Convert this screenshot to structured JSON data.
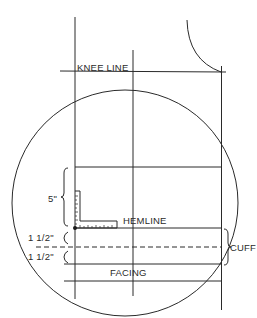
{
  "diagram": {
    "labels": {
      "knee_line": "KNEE LINE",
      "hemline": "HEMLINE",
      "cuff": "CUFF",
      "facing": "FACING",
      "measure_5in": "5\"",
      "measure_cuff_upper": "1 1/2\"",
      "measure_cuff_lower": "1 1/2\""
    },
    "colors": {
      "line": "#2a2a2a",
      "background": "#ffffff"
    }
  }
}
